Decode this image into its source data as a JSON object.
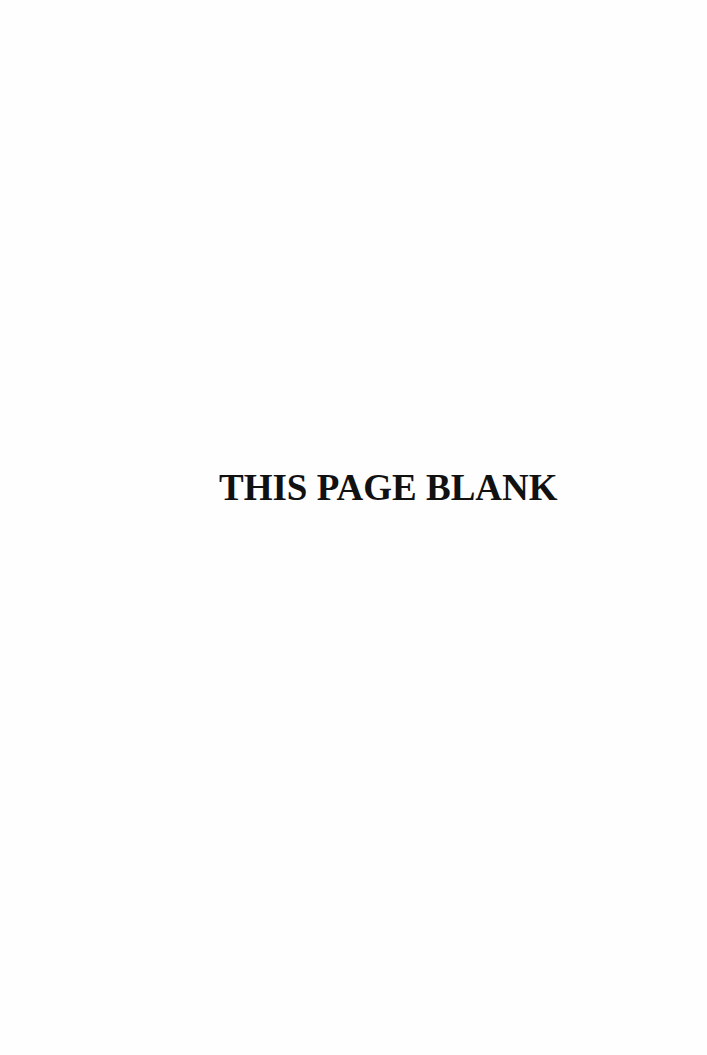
{
  "page": {
    "notice_text": "THIS PAGE BLANK",
    "background_color": "#fefefe",
    "text_color": "#111111"
  }
}
